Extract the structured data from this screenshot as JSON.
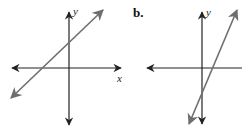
{
  "figure": {
    "panels": [
      {
        "label": "",
        "x_axis_label": "x",
        "y_axis_label": "y",
        "description": "Line with positive slope crossing negative x-axis and positive y-axis"
      },
      {
        "label": "b.",
        "x_axis_label": "",
        "y_axis_label": "y",
        "description": "Steep line with positive slope crossing positive x-axis and negative y-axis"
      }
    ],
    "colors": {
      "axis": "#222222",
      "line": "#707070",
      "background": "#ffffff"
    }
  }
}
